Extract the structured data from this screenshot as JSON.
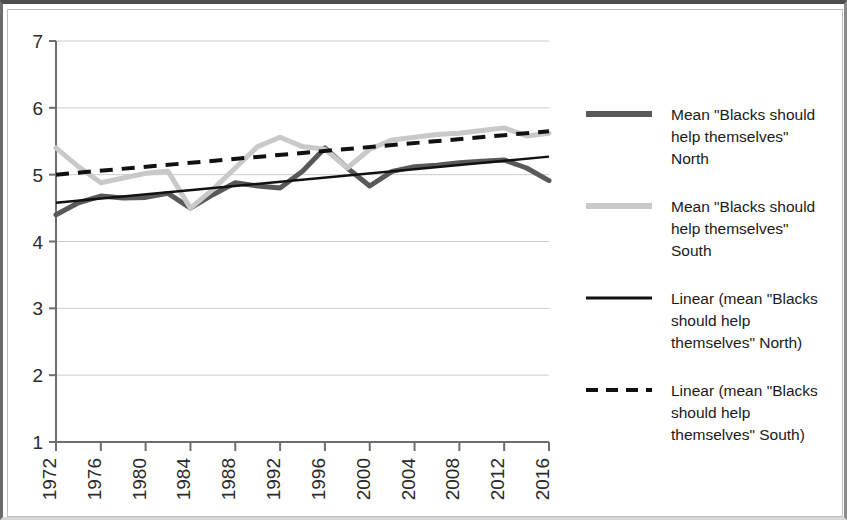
{
  "chart_data": {
    "type": "line",
    "title": "",
    "xlabel": "",
    "ylabel": "",
    "xlim": [
      1972,
      2016
    ],
    "ylim": [
      1,
      7
    ],
    "grid": true,
    "legend_position": "right",
    "y_ticks": [
      "7",
      "6",
      "5",
      "4",
      "3",
      "2",
      "1"
    ],
    "x_ticks": [
      "1972",
      "1976",
      "1980",
      "1984",
      "1988",
      "1992",
      "1996",
      "2000",
      "2004",
      "2008",
      "2012",
      "2016"
    ],
    "x": [
      1972,
      1974,
      1976,
      1978,
      1980,
      1982,
      1984,
      1986,
      1988,
      1990,
      1992,
      1994,
      1996,
      1998,
      2000,
      2002,
      2004,
      2006,
      2008,
      2010,
      2012,
      2014,
      2016
    ],
    "series": [
      {
        "name": "Mean \"Blacks should help themselves\" North",
        "color": "#595959",
        "style": "solid",
        "width": 5,
        "values": [
          4.4,
          4.58,
          4.68,
          4.65,
          4.66,
          4.72,
          4.5,
          4.7,
          4.88,
          4.83,
          4.8,
          5.05,
          5.4,
          5.1,
          4.83,
          5.05,
          5.12,
          5.14,
          5.18,
          5.2,
          5.22,
          5.1,
          4.91
        ]
      },
      {
        "name": "Mean \"Blacks should help themselves\" South",
        "color": "#c9c9c9",
        "style": "solid",
        "width": 5,
        "values": [
          5.4,
          5.12,
          4.88,
          4.95,
          5.02,
          5.05,
          4.5,
          4.78,
          5.1,
          5.42,
          5.56,
          5.42,
          5.38,
          5.1,
          5.38,
          5.52,
          5.56,
          5.6,
          5.62,
          5.66,
          5.7,
          5.58,
          5.62
        ]
      }
    ],
    "trendlines": [
      {
        "name": "Linear (mean \"Blacks should help themselves\" North)",
        "color": "#111111",
        "style": "solid",
        "width": 2.5,
        "start": [
          1972,
          4.58
        ],
        "end": [
          2016,
          5.27
        ]
      },
      {
        "name": "Linear (mean \"Blacks should help themselves\" South)",
        "color": "#111111",
        "style": "dashed",
        "width": 4,
        "start": [
          1972,
          5.0
        ],
        "end": [
          2016,
          5.65
        ]
      }
    ],
    "legend": [
      {
        "label": "Mean \"Blacks should help themselves\" North",
        "lines": [
          "Mean \"Blacks should",
          "help themselves\"",
          "North"
        ],
        "color": "#595959",
        "style": "solid",
        "width": 6
      },
      {
        "label": "Mean \"Blacks should help themselves\" South",
        "lines": [
          "Mean \"Blacks should",
          "help themselves\"",
          "South"
        ],
        "color": "#c9c9c9",
        "style": "solid",
        "width": 6
      },
      {
        "label": "Linear (mean \"Blacks should help themselves\" North)",
        "lines": [
          "Linear (mean \"Blacks",
          "should help",
          "themselves\" North)"
        ],
        "color": "#111111",
        "style": "solid",
        "width": 3
      },
      {
        "label": "Linear (mean \"Blacks should help themselves\" South)",
        "lines": [
          "Linear (mean \"Blacks",
          "should help",
          "themselves\" South)"
        ],
        "color": "#111111",
        "style": "dashed",
        "width": 4
      }
    ]
  }
}
